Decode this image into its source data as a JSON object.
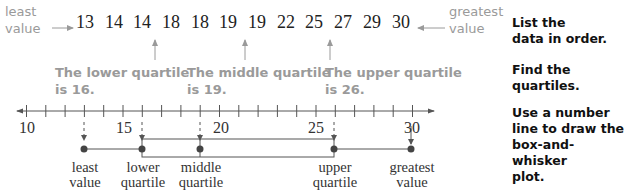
{
  "data_list": {
    "left_label": "least value",
    "left_label_lines": [
      "least",
      "value"
    ],
    "values": [
      "13",
      "14",
      "14",
      "18",
      "18",
      "19",
      "19",
      "22",
      "25",
      "27",
      "29",
      "30"
    ],
    "right_label_lines": [
      "greatest",
      "value"
    ]
  },
  "quartile_notes": [
    {
      "line1": "The lower quartile",
      "line2": "is 16."
    },
    {
      "line1": "The middle quartile",
      "line2": "is 19."
    },
    {
      "line1": "The upper quartile",
      "line2": "is 26."
    }
  ],
  "steps": [
    {
      "lines": [
        "List the",
        "data in order."
      ]
    },
    {
      "lines": [
        "Find the",
        "quartiles."
      ]
    },
    {
      "lines": [
        "Use a number",
        "line to draw the",
        "box-and-whisker",
        "plot."
      ]
    }
  ],
  "number_line": {
    "min": 10,
    "max": 30,
    "tick_labels": [
      "10",
      "15",
      "20",
      "25",
      "30"
    ]
  },
  "plot_points": [
    {
      "line1": "least",
      "line2": "value",
      "value": 13
    },
    {
      "line1": "lower",
      "line2": "quartile",
      "value": 16
    },
    {
      "line1": "middle",
      "line2": "quartile",
      "value": 19
    },
    {
      "line1": "upper",
      "line2": "quartile",
      "value": 26
    },
    {
      "line1": "greatest",
      "line2": "value",
      "value": 30
    }
  ],
  "chart_data": {
    "type": "box-and-whisker",
    "data": [
      13,
      14,
      14,
      18,
      18,
      19,
      19,
      22,
      25,
      27,
      29,
      30
    ],
    "least_value": 13,
    "lower_quartile": 16,
    "median": 19,
    "upper_quartile": 26,
    "greatest_value": 30,
    "axis_range": [
      10,
      30
    ],
    "tick_labels": [
      10,
      15,
      20,
      25,
      30
    ],
    "minor_tick_interval": 1
  },
  "colors": {
    "annotation_gray": "#9a9a9a",
    "plot_line": "#555555",
    "text": "#111111"
  }
}
